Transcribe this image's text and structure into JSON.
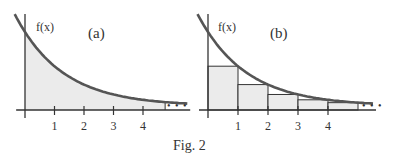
{
  "caption": "Fig. 2",
  "panels": [
    {
      "id": "a",
      "label": "(a)",
      "function_label": "f(x)",
      "ticks": [
        "1",
        "2",
        "3",
        "4"
      ],
      "ellipsis": "• • •",
      "shading": "area-under-curve"
    },
    {
      "id": "b",
      "label": "(b)",
      "function_label": "f(x)",
      "ticks": [
        "1",
        "2",
        "3",
        "4"
      ],
      "ellipsis": "• • •",
      "shading": "right-endpoint-rectangles",
      "rectangle_count": 5
    }
  ],
  "colors": {
    "curve": "#555555",
    "fill": "#ebebeb",
    "axis": "#333333"
  }
}
